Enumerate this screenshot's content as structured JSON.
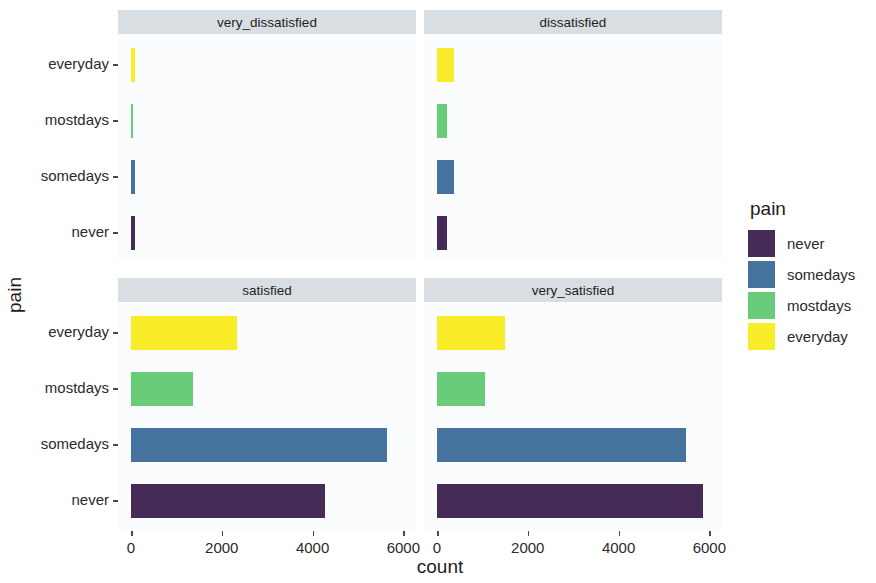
{
  "chart_data": {
    "type": "bar",
    "title": "",
    "subtitle": "",
    "xlabel": "count",
    "ylabel": "pain",
    "orientation": "horizontal",
    "grid": false,
    "legend_position": "right",
    "legend_title": "pain",
    "xlim": [
      0,
      6300
    ],
    "xticks": [
      0,
      2000,
      4000,
      6000
    ],
    "xtick_labels": [
      "0",
      "2000",
      "4000",
      "6000"
    ],
    "categories": [
      "never",
      "somedays",
      "mostdays",
      "everyday"
    ],
    "ytick_labels": [
      "everyday",
      "mostdays",
      "somedays",
      "never"
    ],
    "facet_variable": "satisfaction",
    "facets": [
      {
        "label": "very_dissatisfied",
        "values": {
          "never": 90,
          "somedays": 85,
          "mostdays": 40,
          "everyday": 90
        }
      },
      {
        "label": "dissatisfied",
        "values": {
          "never": 230,
          "somedays": 380,
          "mostdays": 230,
          "everyday": 380
        }
      },
      {
        "label": "satisfied",
        "values": {
          "never": 4270,
          "somedays": 5650,
          "mostdays": 1370,
          "everyday": 2330
        }
      },
      {
        "label": "very_satisfied",
        "values": {
          "never": 5870,
          "somedays": 5490,
          "mostdays": 1060,
          "everyday": 1490
        }
      }
    ],
    "colors": {
      "never": "#452b56",
      "somedays": "#46739e",
      "mostdays": "#68cc78",
      "everyday": "#f9ed2a"
    }
  },
  "legend": {
    "title": "pain",
    "items": [
      {
        "label": "never",
        "color": "#452b56"
      },
      {
        "label": "somedays",
        "color": "#46739e"
      },
      {
        "label": "mostdays",
        "color": "#68cc78"
      },
      {
        "label": "everyday",
        "color": "#f9ed2a"
      }
    ]
  },
  "axes": {
    "x_title": "count",
    "y_title": "pain"
  }
}
